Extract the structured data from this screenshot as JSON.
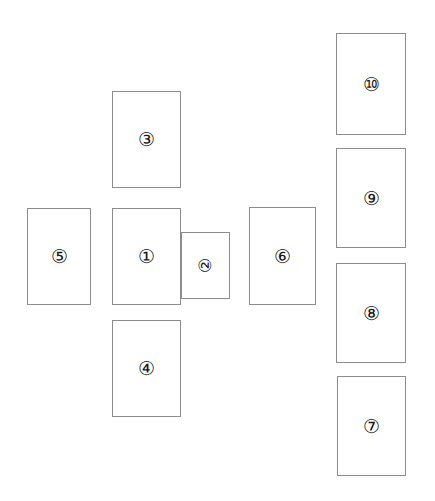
{
  "diagram": {
    "background_color": "#ffffff",
    "border_color": "#8c8c8c",
    "label_color": "#1a1a1a",
    "width": 435,
    "height": 501,
    "cards": [
      {
        "id": "card-1",
        "label": "①",
        "number": "1",
        "x": 112,
        "y": 208,
        "w": 69,
        "h": 97,
        "rotation": 0,
        "z": 3
      },
      {
        "id": "card-2",
        "label": "②",
        "number": "2",
        "x": 181,
        "y": 232,
        "w": 49,
        "h": 67,
        "rotation": -90,
        "z": 2
      },
      {
        "id": "card-3",
        "label": "③",
        "number": "3",
        "x": 112,
        "y": 91,
        "w": 69,
        "h": 97,
        "rotation": 0,
        "z": 1
      },
      {
        "id": "card-4",
        "label": "④",
        "number": "4",
        "x": 112,
        "y": 320,
        "w": 69,
        "h": 97,
        "rotation": 0,
        "z": 1
      },
      {
        "id": "card-5",
        "label": "⑤",
        "number": "5",
        "x": 27,
        "y": 208,
        "w": 64,
        "h": 97,
        "rotation": 0,
        "z": 1
      },
      {
        "id": "card-6",
        "label": "⑥",
        "number": "6",
        "x": 249,
        "y": 207,
        "w": 67,
        "h": 98,
        "rotation": 0,
        "z": 1
      },
      {
        "id": "card-7",
        "label": "⑦",
        "number": "7",
        "x": 337,
        "y": 376,
        "w": 69,
        "h": 100,
        "rotation": 0,
        "z": 1
      },
      {
        "id": "card-8",
        "label": "⑧",
        "number": "8",
        "x": 336,
        "y": 263,
        "w": 70,
        "h": 100,
        "rotation": 0,
        "z": 1
      },
      {
        "id": "card-9",
        "label": "⑨",
        "number": "9",
        "x": 336,
        "y": 148,
        "w": 70,
        "h": 100,
        "rotation": 0,
        "z": 1
      },
      {
        "id": "card-10",
        "label": "⑩",
        "number": "10",
        "x": 336,
        "y": 33,
        "w": 70,
        "h": 102,
        "rotation": 0,
        "z": 1
      }
    ]
  }
}
